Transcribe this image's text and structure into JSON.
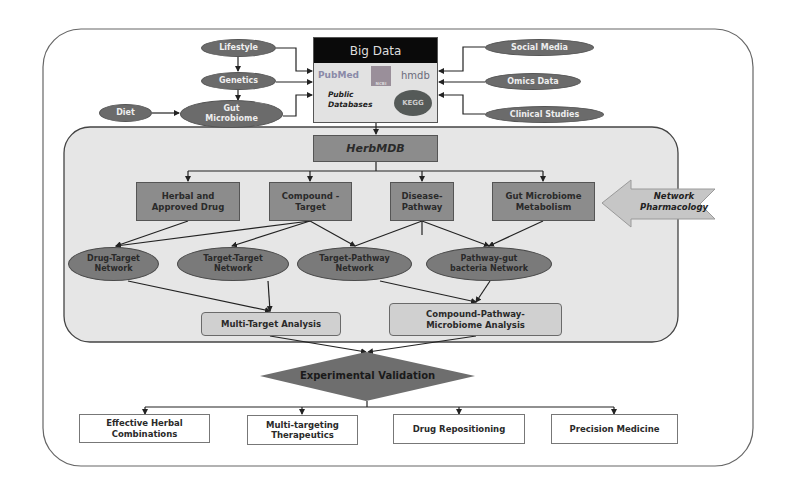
{
  "diagram": {
    "top_inputs_left": [
      {
        "id": "lifestyle",
        "label": "Lifestyle"
      },
      {
        "id": "genetics",
        "label": "Genetics"
      },
      {
        "id": "diet",
        "label": "Diet"
      },
      {
        "id": "gut_microbiome",
        "label": "Gut Microbiome",
        "lines": [
          "Gut",
          "Microbiome"
        ]
      }
    ],
    "top_inputs_right": [
      {
        "id": "social_media",
        "label": "Social Media"
      },
      {
        "id": "omics_data",
        "label": "Omics Data"
      },
      {
        "id": "clinical_studies",
        "label": "Clinical Studies"
      }
    ],
    "big_data": {
      "title": "Big Data",
      "caption_line1": "Public",
      "caption_line2": "Databases",
      "logos": [
        {
          "id": "pubmed",
          "label": "PubMed"
        },
        {
          "id": "ncbi",
          "label": "NCBI"
        },
        {
          "id": "hmdb",
          "label": "hmdb"
        },
        {
          "id": "kegg",
          "label": "KEGG"
        }
      ]
    },
    "herbmdb": {
      "label": "HerbMDB"
    },
    "categories": [
      {
        "id": "herbal",
        "line1": "Herbal and",
        "line2": "Approved Drug"
      },
      {
        "id": "compound_target",
        "line1": "Compound -",
        "line2": "Target"
      },
      {
        "id": "disease_pathway",
        "line1": "Disease-",
        "line2": "Pathway"
      },
      {
        "id": "gut_metabolism",
        "line1": "Gut Microbiome",
        "line2": "Metabolism"
      }
    ],
    "network_pharmacology": {
      "line1": "Network",
      "line2": "Pharmacology"
    },
    "networks": [
      {
        "id": "drug_target",
        "line1": "Drug-Target",
        "line2": "Network"
      },
      {
        "id": "target_target",
        "line1": "Target-Target",
        "line2": "Network"
      },
      {
        "id": "target_pathway",
        "line1": "Target-Pathway",
        "line2": "Network"
      },
      {
        "id": "pathway_gut",
        "line1": "Pathway-gut",
        "line2": "bacteria Network"
      }
    ],
    "analyses": [
      {
        "id": "multi_target",
        "line1": "Multi-Target Analysis"
      },
      {
        "id": "compound_pathway",
        "line1": "Compound-Pathway-",
        "line2": "Microbiome Analysis"
      }
    ],
    "validation": {
      "label": "Experimental Validation"
    },
    "outcomes": [
      {
        "id": "effective_herbal",
        "line1": "Effective Herbal",
        "line2": "Combinations"
      },
      {
        "id": "multi_targeting",
        "line1": "Multi-targeting",
        "line2": "Therapeutics"
      },
      {
        "id": "drug_repositioning",
        "line1": "Drug Repositioning"
      },
      {
        "id": "precision_medicine",
        "line1": "Precision Medicine"
      }
    ],
    "colors": {
      "ellipse_dark": "#6b6b6b",
      "rect_mid": "#8c8c8c",
      "panel_bg": "#e6e6e6",
      "analysis_box": "#d0d0d0",
      "header_black": "#0a0a0a",
      "diamond": "#6e6e6e"
    }
  }
}
